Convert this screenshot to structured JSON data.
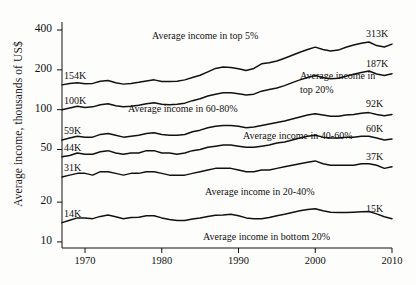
{
  "chart_data": {
    "type": "line",
    "title": "",
    "xlabel": "",
    "ylabel": "Average income, thousands of US$",
    "yscale": "log",
    "ylim": [
      9,
      460
    ],
    "xlim": [
      1967,
      2010
    ],
    "grid": false,
    "legend": "inline annotations at curves",
    "ytick_labels": [
      "400",
      "200",
      "100",
      "50",
      "20",
      "10"
    ],
    "ytick_values": [
      400,
      200,
      100,
      50,
      20,
      10
    ],
    "xtick_labels": [
      "1970",
      "1980",
      "1990",
      "2000",
      "2010"
    ],
    "xtick_values": [
      1970,
      1980,
      1990,
      2000,
      2010
    ],
    "x": [
      1967,
      1968,
      1969,
      1970,
      1971,
      1972,
      1973,
      1974,
      1975,
      1976,
      1977,
      1978,
      1979,
      1980,
      1981,
      1982,
      1983,
      1984,
      1985,
      1986,
      1987,
      1988,
      1989,
      1990,
      1991,
      1992,
      1993,
      1994,
      1995,
      1996,
      1997,
      1998,
      1999,
      2000,
      2001,
      2002,
      2003,
      2004,
      2005,
      2006,
      2007,
      2008,
      2009,
      2010
    ],
    "series": [
      {
        "name": "Average income in top 5%",
        "start_label": "154K",
        "end_label": "313K",
        "start_value": 154,
        "end_value": 313,
        "values": [
          154,
          158,
          160,
          157,
          158,
          164,
          166,
          160,
          156,
          158,
          161,
          165,
          168,
          163,
          163,
          164,
          168,
          175,
          182,
          193,
          205,
          210,
          208,
          204,
          198,
          205,
          222,
          226,
          233,
          245,
          258,
          272,
          285,
          297,
          285,
          278,
          282,
          296,
          308,
          318,
          325,
          305,
          298,
          313
        ]
      },
      {
        "name": "Average income in top 20%",
        "start_label": "100K",
        "end_label": "187K",
        "start_value": 100,
        "end_value": 187,
        "values": [
          100,
          103,
          106,
          104,
          105,
          109,
          111,
          107,
          105,
          106,
          108,
          111,
          113,
          110,
          109,
          110,
          112,
          117,
          121,
          127,
          131,
          134,
          134,
          132,
          129,
          131,
          138,
          142,
          146,
          152,
          160,
          168,
          175,
          181,
          175,
          171,
          173,
          179,
          185,
          191,
          196,
          186,
          181,
          187
        ]
      },
      {
        "name": "Average income in 60-80%",
        "start_label": "59K",
        "end_label": "92K",
        "start_value": 59,
        "end_value": 92,
        "values": [
          59,
          61,
          63,
          62,
          62,
          65,
          66,
          64,
          62,
          63,
          64,
          66,
          67,
          65,
          64,
          64,
          65,
          68,
          70,
          73,
          75,
          76,
          76,
          75,
          73,
          74,
          76,
          78,
          80,
          82,
          85,
          88,
          91,
          93,
          91,
          89,
          89,
          91,
          92,
          94,
          95,
          92,
          90,
          92
        ]
      },
      {
        "name": "Average income in 40-60%",
        "start_label": "44K",
        "end_label": "60K",
        "start_value": 44,
        "end_value": 60,
        "values": [
          44,
          45,
          47,
          46,
          46,
          48,
          49,
          47,
          46,
          47,
          47,
          49,
          49,
          47,
          47,
          46,
          47,
          49,
          50,
          52,
          53,
          54,
          54,
          53,
          52,
          52,
          53,
          54,
          56,
          57,
          59,
          61,
          63,
          64,
          62,
          61,
          61,
          62,
          62,
          63,
          63,
          61,
          59,
          60
        ]
      },
      {
        "name": "Average income in 20-40%",
        "start_label": "31K",
        "end_label": "37K",
        "start_value": 31,
        "end_value": 37,
        "values": [
          31,
          32,
          33,
          33,
          32,
          34,
          34,
          33,
          32,
          33,
          33,
          34,
          34,
          33,
          32,
          32,
          32,
          33,
          34,
          35,
          36,
          36,
          36,
          35,
          34,
          34,
          35,
          35,
          36,
          37,
          38,
          39,
          40,
          41,
          39,
          38,
          38,
          38,
          38,
          39,
          39,
          38,
          36,
          37
        ]
      },
      {
        "name": "Average income in bottom 20%",
        "start_label": "14K",
        "end_label": "15K",
        "start_value": 14,
        "end_value": 15,
        "values": [
          14,
          14.6,
          15.2,
          15.2,
          15.0,
          15.6,
          16.0,
          15.5,
          15.0,
          15.3,
          15.4,
          15.8,
          15.8,
          15.2,
          14.8,
          14.5,
          14.5,
          14.9,
          15.2,
          15.6,
          15.9,
          16.0,
          16.2,
          15.8,
          15.2,
          15.0,
          15.0,
          15.3,
          15.8,
          16.2,
          16.7,
          17.2,
          17.6,
          17.8,
          17.2,
          16.8,
          16.7,
          16.7,
          16.8,
          16.9,
          17.0,
          16.3,
          15.5,
          15.0
        ]
      }
    ]
  },
  "axis": {
    "y_title": "Average income, thousands of US$"
  }
}
